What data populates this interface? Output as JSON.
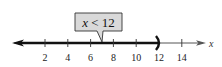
{
  "number_line": {
    "min": 0,
    "max": 15,
    "ticks": [
      2,
      4,
      6,
      8,
      10,
      12,
      14
    ],
    "tick_labels": [
      "2",
      "4",
      "6",
      "8",
      "10",
      "12",
      "14"
    ],
    "axis_variable": "x",
    "shaded_from": "-infinity",
    "shaded_to": 12,
    "endpoint": {
      "value": 12,
      "type": "open",
      "symbol": ")"
    }
  },
  "callout": {
    "variable": "x",
    "operator": "<",
    "value": "12",
    "points_to": 7
  },
  "colors": {
    "line": "#111111",
    "thin_line": "#555555",
    "callout_fill": "#d9d9d9",
    "callout_border": "#333333"
  }
}
